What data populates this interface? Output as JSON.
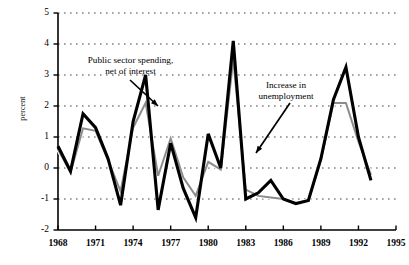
{
  "figure": {
    "background_color": "#ffffff",
    "plot_border_color": "#000000"
  },
  "axes": {
    "y_axis_label": "percent",
    "y_ticks": [
      "5",
      "4",
      "3",
      "2",
      "1",
      "0",
      "-1",
      "-2"
    ],
    "y_tick_values": [
      5,
      4,
      3,
      2,
      1,
      0,
      -1,
      -2
    ],
    "ylim": [
      -2,
      5
    ],
    "x_ticks": [
      "1968",
      "1971",
      "1974",
      "1977",
      "1980",
      "1983",
      "1986",
      "1989",
      "1992",
      "1995"
    ],
    "x_tick_values": [
      1968,
      1971,
      1974,
      1977,
      1980,
      1983,
      1986,
      1989,
      1992,
      1995
    ],
    "xlim": [
      1968,
      1995
    ],
    "grid": "horizontal-dotted"
  },
  "annotations": [
    {
      "id": "spending",
      "line1": "Public sector spending,",
      "line2": "net of interest",
      "arrow_from": [
        130,
        80
      ],
      "arrow_to": [
        158,
        106
      ]
    },
    {
      "id": "unemployment",
      "line1": "Increase in",
      "line2": "unemployment",
      "arrow_from": [
        290,
        103
      ],
      "arrow_to": [
        256,
        153
      ]
    }
  ],
  "chart_data": {
    "type": "line",
    "title": "",
    "xlabel": "",
    "ylabel": "percent",
    "xlim": [
      1968,
      1995
    ],
    "ylim": [
      -2,
      5
    ],
    "grid": true,
    "legend": "annotations-inline",
    "x": [
      1968,
      1969,
      1970,
      1971,
      1972,
      1973,
      1974,
      1975,
      1976,
      1977,
      1978,
      1979,
      1980,
      1981,
      1982,
      1983,
      1984,
      1985,
      1986,
      1987,
      1988,
      1989,
      1990,
      1991,
      1992,
      1993
    ],
    "series": [
      {
        "name": "Public sector spending, net of interest",
        "color": "#000000",
        "linewidth": 3.1,
        "values": [
          0.7,
          -0.1,
          1.75,
          1.3,
          0.3,
          -1.2,
          1.5,
          3.0,
          -1.35,
          0.8,
          -0.65,
          -1.6,
          1.1,
          0.0,
          4.1,
          -1.0,
          -0.8,
          -0.4,
          -1.0,
          -1.15,
          -1.05,
          0.3,
          2.2,
          3.25,
          1.0,
          -0.4
        ]
      },
      {
        "name": "Increase in unemployment",
        "color": "#8c8c8c",
        "linewidth": 2.0,
        "values": [
          0.6,
          -0.15,
          1.28,
          1.2,
          0.25,
          -0.75,
          1.3,
          2.1,
          -0.25,
          0.95,
          -0.3,
          -0.9,
          0.2,
          -0.05,
          3.5,
          -0.7,
          -0.9,
          -0.95,
          -1.0,
          -1.12,
          -1.05,
          0.25,
          2.1,
          2.1,
          0.85,
          -0.22
        ]
      }
    ]
  }
}
